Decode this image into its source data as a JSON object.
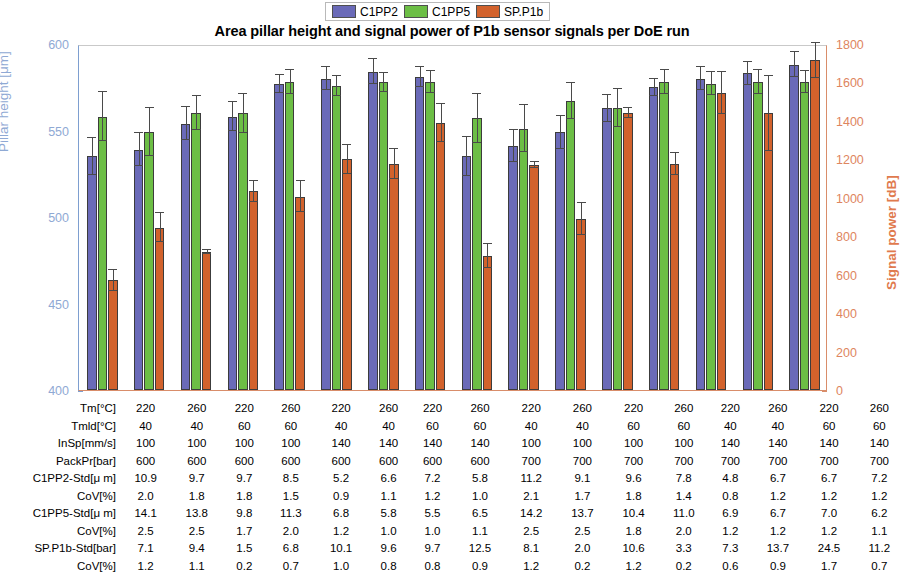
{
  "title": "Area pillar height and signal power of P1b sensor signals per DoE run",
  "legend": [
    {
      "label": "C1PP2",
      "color": "#6a6ab8"
    },
    {
      "label": "C1PP5",
      "color": "#6cbe45"
    },
    {
      "label": "SP.P1b",
      "color": "#d2622c"
    }
  ],
  "axes": {
    "left_title": "Pillar height [μm]",
    "right_title": "Signal power [dB]",
    "left_color": "#8fa9d4",
    "right_color": "#e07a4e",
    "left_ticks": [
      "400",
      "450",
      "500",
      "550",
      "600"
    ],
    "right_ticks": [
      "0",
      "200",
      "400",
      "600",
      "800",
      "1000",
      "1200",
      "1400",
      "1600",
      "1800"
    ]
  },
  "table": {
    "row_labels": [
      "Tm[°C]",
      "Tmld[°C]",
      "InSp[mm/s]",
      "PackPr[bar]",
      "C1PP2-Std[μ m]",
      "CoV[%]",
      "C1PP5-Std[μ m]",
      "CoV[%]",
      "SP.P1b-Std[bar]",
      "CoV[%]"
    ],
    "rows": [
      [
        "220",
        "260",
        "220",
        "260",
        "220",
        "260",
        "220",
        "260",
        "220",
        "260",
        "220",
        "260",
        "220",
        "260",
        "220",
        "260"
      ],
      [
        "40",
        "40",
        "60",
        "60",
        "40",
        "40",
        "60",
        "60",
        "40",
        "40",
        "60",
        "60",
        "40",
        "40",
        "60",
        "60"
      ],
      [
        "100",
        "100",
        "100",
        "100",
        "140",
        "140",
        "140",
        "140",
        "100",
        "100",
        "100",
        "100",
        "140",
        "140",
        "140",
        "140"
      ],
      [
        "600",
        "600",
        "600",
        "600",
        "600",
        "600",
        "600",
        "600",
        "700",
        "700",
        "700",
        "700",
        "700",
        "700",
        "700",
        "700"
      ],
      [
        "10.9",
        "9.7",
        "9.7",
        "8.5",
        "5.2",
        "6.6",
        "7.2",
        "5.8",
        "11.2",
        "9.1",
        "9.6",
        "7.8",
        "4.8",
        "6.7",
        "6.7",
        "7.2"
      ],
      [
        "2.0",
        "1.8",
        "1.8",
        "1.5",
        "0.9",
        "1.1",
        "1.2",
        "1.0",
        "2.1",
        "1.7",
        "1.8",
        "1.4",
        "0.8",
        "1.2",
        "1.2",
        "1.2"
      ],
      [
        "14.1",
        "13.8",
        "9.8",
        "11.3",
        "6.8",
        "5.8",
        "5.5",
        "6.5",
        "14.2",
        "13.7",
        "10.4",
        "11.0",
        "6.9",
        "6.7",
        "7.0",
        "6.2"
      ],
      [
        "2.5",
        "2.5",
        "1.7",
        "2.0",
        "1.2",
        "1.0",
        "1.0",
        "1.1",
        "2.5",
        "2.5",
        "1.8",
        "2.0",
        "1.2",
        "1.2",
        "1.2",
        "1.1"
      ],
      [
        "7.1",
        "9.4",
        "1.5",
        "6.8",
        "10.1",
        "9.6",
        "9.7",
        "12.5",
        "8.1",
        "2.0",
        "10.6",
        "3.3",
        "7.3",
        "13.7",
        "24.5",
        "11.2"
      ],
      [
        "1.2",
        "1.1",
        "0.2",
        "0.7",
        "1.0",
        "0.8",
        "0.8",
        "0.9",
        "1.2",
        "0.2",
        "1.2",
        "0.2",
        "0.6",
        "0.9",
        "1.7",
        "0.7"
      ]
    ]
  },
  "chart_data": {
    "type": "bar",
    "title": "Area pillar height and signal power of P1b sensor signals per DoE run",
    "xlabel": "",
    "ylabel": "Pillar height [μm]",
    "y2label": "Signal power [dB]",
    "ylim": [
      400,
      600
    ],
    "y2lim": [
      0,
      1800
    ],
    "grid": false,
    "legend_position": "top-center",
    "categories": [
      "1",
      "2",
      "3",
      "4",
      "5",
      "6",
      "7",
      "8",
      "9",
      "10",
      "11",
      "12",
      "13",
      "14",
      "15",
      "16"
    ],
    "series": [
      {
        "name": "C1PP2",
        "axis": "left",
        "color": "#6a6ab8",
        "values": [
          535,
          539,
          554,
          558,
          577,
          580,
          584,
          581,
          535,
          541,
          549,
          563,
          575,
          580,
          583,
          588
        ],
        "errors": [
          10.9,
          9.7,
          9.7,
          8.5,
          5.2,
          6.6,
          7.2,
          5.8,
          11.2,
          9.1,
          9.6,
          7.8,
          4.8,
          6.7,
          6.7,
          7.2
        ]
      },
      {
        "name": "C1PP5",
        "axis": "left",
        "color": "#6cbe45",
        "values": [
          558,
          549,
          560,
          560,
          578,
          576,
          578,
          578,
          557,
          551,
          567,
          563,
          578,
          577,
          578,
          578
        ],
        "errors": [
          14.1,
          13.8,
          9.8,
          11.3,
          6.8,
          5.8,
          5.5,
          6.5,
          14.2,
          13.7,
          10.4,
          11.0,
          6.9,
          6.7,
          7.0,
          6.2
        ]
      },
      {
        "name": "SP.P1b",
        "axis": "right",
        "color": "#d2622c",
        "values": [
          570,
          845,
          718,
          1035,
          1005,
          1200,
          1175,
          1390,
          697,
          1170,
          890,
          1440,
          1175,
          1545,
          1440,
          1715
        ],
        "errors": [
          7.1,
          9.4,
          1.5,
          6.8,
          10.1,
          9.6,
          9.7,
          12.5,
          8.1,
          2.0,
          10.6,
          3.3,
          7.3,
          13.7,
          24.5,
          11.2
        ]
      }
    ]
  }
}
